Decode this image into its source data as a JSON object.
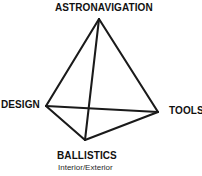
{
  "diagram": {
    "type": "tetrahedron-concept-diagram",
    "background_color": "#ffffff",
    "stroke_color": "#1a1a1a",
    "stroke_width": 2,
    "vertices": [
      {
        "id": "apex",
        "label": "ASTRONAVIGATION",
        "x": 99,
        "y": 19
      },
      {
        "id": "left",
        "label": "DESIGN",
        "x": 46,
        "y": 106
      },
      {
        "id": "right",
        "label": "TOOLS",
        "x": 158,
        "y": 112
      },
      {
        "id": "bottom",
        "label": "BALLISTICS",
        "sublabel": "Interior/Exterior",
        "x": 85,
        "y": 140
      }
    ],
    "edges": [
      {
        "from": "apex",
        "to": "left"
      },
      {
        "from": "apex",
        "to": "right"
      },
      {
        "from": "apex",
        "to": "bottom"
      },
      {
        "from": "left",
        "to": "right"
      },
      {
        "from": "left",
        "to": "bottom"
      },
      {
        "from": "right",
        "to": "bottom"
      }
    ],
    "labels": {
      "apex": "ASTRONAVIGATION",
      "left": "DESIGN",
      "right": "TOOLS",
      "bottom": "BALLISTICS",
      "bottom_sub": "Interior/Exterior"
    }
  }
}
